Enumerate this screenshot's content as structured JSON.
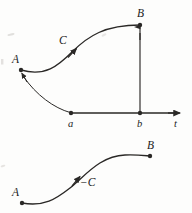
{
  "figure": {
    "type": "math-curve-orientation-diagram",
    "ink_color": "#2a2826",
    "paper_color": "#fdfdfc",
    "top_panel": {
      "caption_points": {
        "start_label": "A",
        "end_label": "B",
        "curve_label": "C"
      },
      "axis": {
        "axis_label": "t",
        "tick_labels": [
          "a",
          "b"
        ]
      }
    },
    "bottom_panel": {
      "start_label": "A",
      "end_label": "B",
      "curve_label": "-C"
    }
  },
  "labels": {
    "A_top": "A",
    "B_top": "B",
    "C_top": "C",
    "a_tick": "a",
    "b_tick": "b",
    "t_axis": "t",
    "A_bottom": "A",
    "B_bottom": "B",
    "negC_bottom": "−C"
  }
}
